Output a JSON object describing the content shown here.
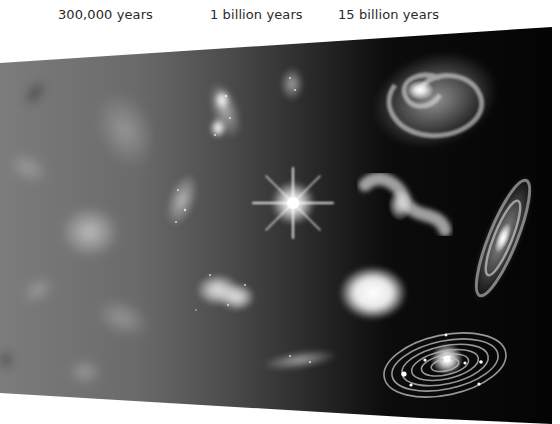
{
  "figure": {
    "time_labels": [
      {
        "id": "early",
        "text": "300,000 years"
      },
      {
        "id": "middle",
        "text": "1 billion years"
      },
      {
        "id": "late",
        "text": "15 billion years"
      }
    ],
    "colors": {
      "background_page": "#ffffff",
      "panel_left": "#7a7a7a",
      "panel_mid": "#4a4a4a",
      "panel_right": "#060606",
      "label_text": "#2a2a2a"
    },
    "objects": [
      {
        "type": "diffuse-clump",
        "region": "early"
      },
      {
        "type": "diffuse-cloud",
        "region": "early"
      },
      {
        "type": "protogalaxy",
        "region": "middle"
      },
      {
        "type": "bright-star",
        "region": "middle"
      },
      {
        "type": "colliding-galaxies",
        "region": "middle"
      },
      {
        "type": "irregular-galaxy",
        "region": "middle"
      },
      {
        "type": "spiral-galaxy-face-on",
        "region": "late"
      },
      {
        "type": "interacting-galaxy",
        "region": "late"
      },
      {
        "type": "elliptical-galaxy",
        "region": "late"
      },
      {
        "type": "spiral-galaxy-edge-tilted",
        "region": "late"
      },
      {
        "type": "solar-system-orbits",
        "region": "late"
      }
    ]
  }
}
